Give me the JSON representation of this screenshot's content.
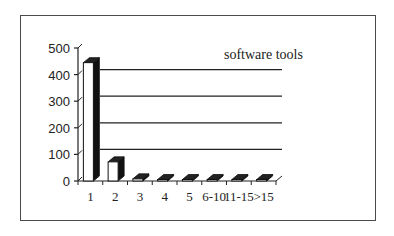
{
  "chart_data": {
    "type": "bar",
    "title": "",
    "legend": [
      "software tools"
    ],
    "categories": [
      "1",
      "2",
      "3",
      "4",
      "5",
      "6-10",
      "11-15",
      ">15"
    ],
    "series": [
      {
        "name": "software tools",
        "values": [
          445,
          72,
          8,
          0,
          0,
          0,
          0,
          0
        ]
      }
    ],
    "xlabel": "",
    "ylabel": "",
    "ylim": [
      0,
      500
    ],
    "yticks": [
      "0",
      "100",
      "200",
      "300",
      "400",
      "500"
    ],
    "grid": true,
    "style": "3d-column"
  },
  "legend_label": "software tools"
}
